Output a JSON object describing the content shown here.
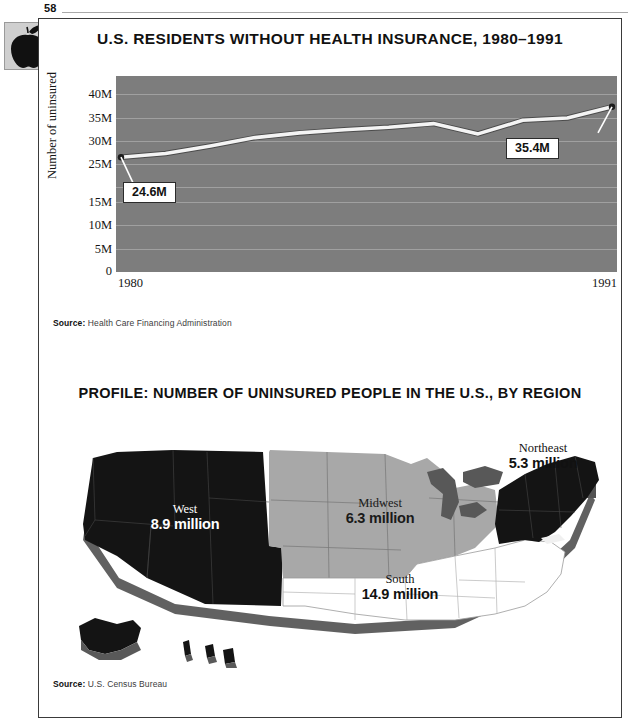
{
  "page": {
    "number": "58",
    "badge_icon": "apple-icon"
  },
  "section_insurance": {
    "title": "U.S. RESIDENTS WITHOUT HEALTH INSURANCE, 1980–1991",
    "source_label": "Source:",
    "source_text": "Health Care Financing Administration"
  },
  "section_region": {
    "title": "PROFILE: NUMBER OF UNINSURED PEOPLE IN THE U.S., BY REGION",
    "source_label": "Source:",
    "source_text": "U.S. Census Bureau"
  },
  "chart_data": [
    {
      "type": "line",
      "title": "U.S. RESIDENTS WITHOUT HEALTH INSURANCE, 1980–1991",
      "xlabel": "",
      "ylabel": "Number of uninsured",
      "x": [
        1980,
        1981,
        1982,
        1983,
        1984,
        1985,
        1986,
        1987,
        1988,
        1989,
        1990,
        1991
      ],
      "values": [
        24.6,
        25.4,
        27.0,
        28.8,
        29.8,
        30.5,
        31.0,
        31.8,
        29.6,
        32.5,
        33.0,
        35.4
      ],
      "xtick_labels": [
        "1980",
        "1991"
      ],
      "ytick_labels": [
        "40M",
        "35M",
        "30M",
        "25M",
        "15M",
        "10M",
        "5M",
        "0"
      ],
      "ytick_values": [
        40,
        35,
        30,
        25,
        15,
        10,
        5,
        0
      ],
      "ylim": [
        0,
        42
      ],
      "grid": true,
      "plot_background": "#7d7d7d",
      "line_color": "#f2f2f2",
      "annotations": [
        {
          "label": "24.6M",
          "point_year": 1980,
          "point_value": 24.6
        },
        {
          "label": "35.4M",
          "point_year": 1991,
          "point_value": 35.4
        }
      ]
    },
    {
      "type": "map",
      "title": "PROFILE: NUMBER OF UNINSURED PEOPLE IN THE U.S., BY REGION",
      "unit": "million",
      "regions": [
        {
          "name": "West",
          "value": "8.9 million",
          "number": 8.9,
          "fill": "#141414",
          "label_color": "#ffffff"
        },
        {
          "name": "Midwest",
          "value": "6.3 million",
          "number": 6.3,
          "fill": "#a8a8a8",
          "label_color": "#1a1a1a"
        },
        {
          "name": "South",
          "value": "14.9 million",
          "number": 14.9,
          "fill": "#ffffff",
          "label_color": "#111111"
        },
        {
          "name": "Northeast",
          "value": "5.3 million",
          "number": 5.3,
          "fill": "#141414",
          "label_color": "#111111"
        }
      ]
    }
  ]
}
